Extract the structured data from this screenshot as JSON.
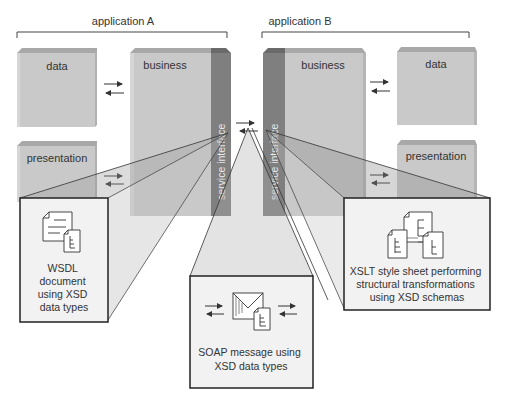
{
  "diagram": {
    "applications": [
      {
        "id": "A",
        "label": "application A",
        "layers": {
          "data": "data",
          "presentation": "presentation",
          "business": "business",
          "service_interface": "service interface"
        }
      },
      {
        "id": "B",
        "label": "application B",
        "layers": {
          "data": "data",
          "presentation": "presentation",
          "business": "business",
          "service_interface": "service interface"
        }
      }
    ],
    "callouts": {
      "wsdl": {
        "icon": "document-with-schema-icon",
        "lines": [
          "WSDL",
          "document",
          "using XSD",
          "data types"
        ]
      },
      "soap": {
        "icon": "envelope-with-schema-icon",
        "lines": [
          "SOAP message using",
          "XSD data types"
        ]
      },
      "xslt": {
        "icon": "stylesheet-transform-icon",
        "lines": [
          "XSLT style sheet performing",
          "structural transformations",
          "using XSD schemas"
        ]
      }
    },
    "arrows": {
      "between_layers": "bidirectional-arrow-icon",
      "between_services": "bidirectional-arrow-icon"
    },
    "colors": {
      "block_face": "#c9c9c9",
      "block_top": "#a8a8a8",
      "block_side": "#b5b5b5",
      "service_strip": "#7f7f7f",
      "service_strip_top": "#6a6a6a",
      "callout_fill": "#f2f2f2",
      "callout_border": "#333333",
      "text": "#333333"
    }
  }
}
